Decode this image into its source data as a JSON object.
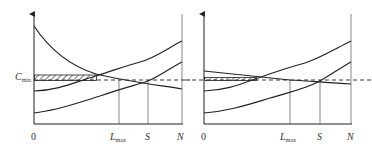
{
  "figure": {
    "panels": [
      {
        "id": "left",
        "y_label": "C",
        "y_label_sub": "min",
        "x_origin": "0",
        "x_ticks": [
          {
            "label": "L",
            "sub": "max"
          },
          {
            "label": "S",
            "sub": ""
          },
          {
            "label": "N",
            "sub": ""
          }
        ]
      },
      {
        "id": "right",
        "x_origin": "0",
        "x_ticks": [
          {
            "label": "L",
            "sub": "max"
          },
          {
            "label": "S",
            "sub": ""
          },
          {
            "label": "N",
            "sub": ""
          }
        ]
      }
    ],
    "colors": {
      "line": "#222222",
      "guide": "#555555"
    }
  }
}
